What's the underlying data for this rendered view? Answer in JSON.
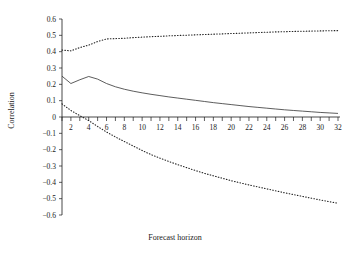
{
  "chart_data": {
    "type": "line",
    "title": "",
    "xlabel": "Forecast horizon",
    "ylabel": "Correlation",
    "xlim": [
      1,
      32
    ],
    "ylim": [
      -0.6,
      0.6
    ],
    "grid": false,
    "legend": "none",
    "x": [
      1,
      2,
      3,
      4,
      5,
      6,
      7,
      8,
      9,
      10,
      11,
      12,
      13,
      14,
      15,
      16,
      17,
      18,
      19,
      20,
      21,
      22,
      23,
      24,
      25,
      26,
      27,
      28,
      29,
      30,
      31,
      32
    ],
    "xticks": [
      2,
      4,
      6,
      8,
      10,
      12,
      14,
      16,
      18,
      20,
      22,
      24,
      26,
      28,
      30,
      32
    ],
    "xticklabels": [
      "2",
      "4",
      "6",
      "8",
      "10",
      "12",
      "14",
      "16",
      "18",
      "20",
      "22",
      "24",
      "26",
      "28",
      "30",
      "32"
    ],
    "yticks": [
      -0.6,
      -0.5,
      -0.4,
      -0.3,
      -0.2,
      -0.1,
      0,
      0.1,
      0.2,
      0.3,
      0.4,
      0.5,
      0.6
    ],
    "yticklabels": [
      "−0.6",
      "−0.5",
      "−0.4",
      "−0.3",
      "−0.2",
      "−0.1",
      "0",
      "0.1",
      "0.2",
      "0.3",
      "0.4",
      "0.5",
      "0.6"
    ],
    "series": [
      {
        "name": "Upper confidence band",
        "style": "dotted",
        "values": [
          0.41,
          0.405,
          0.425,
          0.44,
          0.462,
          0.478,
          0.48,
          0.482,
          0.486,
          0.489,
          0.492,
          0.494,
          0.497,
          0.499,
          0.501,
          0.503,
          0.505,
          0.507,
          0.509,
          0.511,
          0.513,
          0.515,
          0.517,
          0.519,
          0.521,
          0.522,
          0.524,
          0.525,
          0.526,
          0.527,
          0.528,
          0.529
        ]
      },
      {
        "name": "Correlation estimate",
        "style": "solid",
        "values": [
          0.25,
          0.205,
          0.228,
          0.248,
          0.232,
          0.205,
          0.185,
          0.17,
          0.158,
          0.148,
          0.139,
          0.131,
          0.123,
          0.116,
          0.109,
          0.102,
          0.095,
          0.088,
          0.082,
          0.076,
          0.07,
          0.064,
          0.059,
          0.054,
          0.049,
          0.044,
          0.04,
          0.036,
          0.032,
          0.028,
          0.025,
          0.022
        ]
      },
      {
        "name": "Lower confidence band",
        "style": "dotted",
        "values": [
          0.08,
          0.04,
          0.008,
          -0.022,
          -0.058,
          -0.092,
          -0.122,
          -0.15,
          -0.178,
          -0.205,
          -0.23,
          -0.252,
          -0.272,
          -0.292,
          -0.31,
          -0.328,
          -0.345,
          -0.36,
          -0.375,
          -0.39,
          -0.403,
          -0.416,
          -0.428,
          -0.44,
          -0.452,
          -0.464,
          -0.475,
          -0.486,
          -0.497,
          -0.508,
          -0.518,
          -0.528
        ]
      }
    ]
  }
}
